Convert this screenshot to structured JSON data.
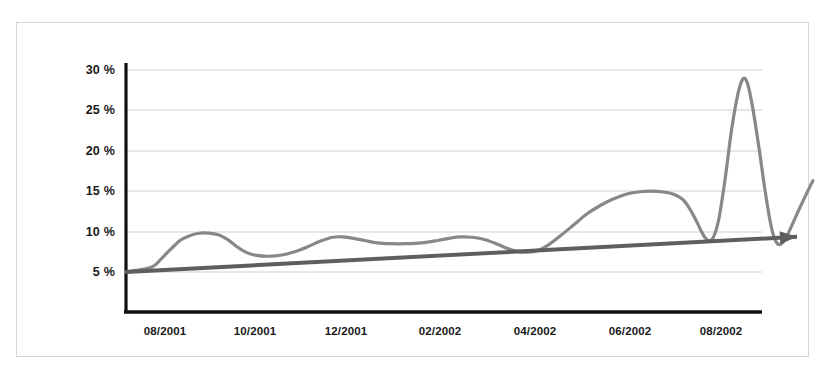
{
  "figure": {
    "background": "#ffffff",
    "frame_color": "#d6d6d6",
    "axis_color": "#111111"
  },
  "chart_data": {
    "type": "line",
    "title": "",
    "subtitle": "",
    "xlabel": "",
    "ylabel": "",
    "grid": true,
    "legend_position": "none",
    "ylim": [
      0,
      32
    ],
    "y_ticks": [
      5,
      10,
      15,
      20,
      25,
      30
    ],
    "y_tick_labels": [
      "5 %",
      "10 %",
      "15 %",
      "20 %",
      "25 %",
      "30 %"
    ],
    "x_tick_labels": [
      "08/2001",
      "10/2001",
      "12/2001",
      "02/2002",
      "04/2002",
      "06/2002",
      "08/2002"
    ],
    "series": [
      {
        "name": "measured-series",
        "color": "#888888",
        "width": 3.2,
        "style": "smooth",
        "points": [
          {
            "x": 0.0,
            "y": 5.0
          },
          {
            "x": 0.04,
            "y": 5.6
          },
          {
            "x": 0.055,
            "y": 6.6
          },
          {
            "x": 0.07,
            "y": 7.8
          },
          {
            "x": 0.085,
            "y": 8.9
          },
          {
            "x": 0.1,
            "y": 9.5
          },
          {
            "x": 0.115,
            "y": 9.8
          },
          {
            "x": 0.13,
            "y": 9.8
          },
          {
            "x": 0.145,
            "y": 9.6
          },
          {
            "x": 0.16,
            "y": 9.0
          },
          {
            "x": 0.175,
            "y": 8.1
          },
          {
            "x": 0.19,
            "y": 7.4
          },
          {
            "x": 0.205,
            "y": 7.05
          },
          {
            "x": 0.225,
            "y": 6.95
          },
          {
            "x": 0.245,
            "y": 7.1
          },
          {
            "x": 0.265,
            "y": 7.5
          },
          {
            "x": 0.285,
            "y": 8.1
          },
          {
            "x": 0.305,
            "y": 8.8
          },
          {
            "x": 0.325,
            "y": 9.3
          },
          {
            "x": 0.34,
            "y": 9.35
          },
          {
            "x": 0.355,
            "y": 9.2
          },
          {
            "x": 0.375,
            "y": 8.9
          },
          {
            "x": 0.395,
            "y": 8.6
          },
          {
            "x": 0.415,
            "y": 8.5
          },
          {
            "x": 0.44,
            "y": 8.5
          },
          {
            "x": 0.465,
            "y": 8.6
          },
          {
            "x": 0.49,
            "y": 8.9
          },
          {
            "x": 0.51,
            "y": 9.2
          },
          {
            "x": 0.525,
            "y": 9.35
          },
          {
            "x": 0.545,
            "y": 9.3
          },
          {
            "x": 0.565,
            "y": 9.0
          },
          {
            "x": 0.585,
            "y": 8.4
          },
          {
            "x": 0.6,
            "y": 7.9
          },
          {
            "x": 0.615,
            "y": 7.55
          },
          {
            "x": 0.628,
            "y": 7.45
          },
          {
            "x": 0.645,
            "y": 7.6
          },
          {
            "x": 0.665,
            "y": 8.4
          },
          {
            "x": 0.685,
            "y": 9.6
          },
          {
            "x": 0.705,
            "y": 10.9
          },
          {
            "x": 0.725,
            "y": 12.2
          },
          {
            "x": 0.745,
            "y": 13.2
          },
          {
            "x": 0.765,
            "y": 14.0
          },
          {
            "x": 0.785,
            "y": 14.6
          },
          {
            "x": 0.805,
            "y": 14.9
          },
          {
            "x": 0.825,
            "y": 15.0
          },
          {
            "x": 0.845,
            "y": 14.9
          },
          {
            "x": 0.862,
            "y": 14.6
          },
          {
            "x": 0.875,
            "y": 14.0
          },
          {
            "x": 0.885,
            "y": 13.0
          },
          {
            "x": 0.895,
            "y": 11.6
          },
          {
            "x": 0.903,
            "y": 10.3
          },
          {
            "x": 0.91,
            "y": 9.3
          },
          {
            "x": 0.916,
            "y": 8.9
          },
          {
            "x": 0.923,
            "y": 9.2
          },
          {
            "x": 0.932,
            "y": 11.5
          },
          {
            "x": 0.942,
            "y": 16.5
          },
          {
            "x": 0.952,
            "y": 22.5
          },
          {
            "x": 0.962,
            "y": 27.0
          },
          {
            "x": 0.97,
            "y": 28.9
          },
          {
            "x": 0.977,
            "y": 28.4
          },
          {
            "x": 0.985,
            "y": 25.5
          },
          {
            "x": 0.995,
            "y": 20.5
          },
          {
            "x": 1.005,
            "y": 15.0
          },
          {
            "x": 1.014,
            "y": 10.8
          },
          {
            "x": 1.021,
            "y": 8.9
          },
          {
            "x": 1.028,
            "y": 8.4
          },
          {
            "x": 1.036,
            "y": 9.0
          },
          {
            "x": 1.046,
            "y": 10.6
          },
          {
            "x": 1.058,
            "y": 12.7
          },
          {
            "x": 1.07,
            "y": 14.7
          },
          {
            "x": 1.08,
            "y": 16.3
          }
        ]
      },
      {
        "name": "trend-line",
        "color": "#5e5e5e",
        "width": 4,
        "style": "straight-arrow",
        "points": [
          {
            "x": 0.0,
            "y": 5.0
          },
          {
            "x": 1.055,
            "y": 9.35
          }
        ],
        "has_arrowhead": true
      }
    ]
  }
}
